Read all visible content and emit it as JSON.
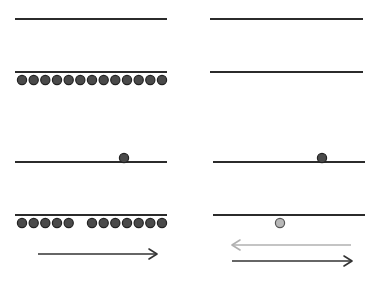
{
  "colors": {
    "line": "#2b2b2b",
    "dot_fill": "#4a4a4a",
    "dot_stroke": "#222222",
    "dot_light_fill": "#b8b8b8",
    "dot_light_stroke": "#555555",
    "arrow_dark": "#333333",
    "arrow_light": "#b0b0b0"
  },
  "panels": [
    {
      "id": "left",
      "lines": [
        {
          "x1": 15,
          "x2": 167,
          "y": 19
        },
        {
          "x1": 15,
          "x2": 167,
          "y": 72
        },
        {
          "x1": 15,
          "x2": 167,
          "y": 162
        },
        {
          "x1": 15,
          "x2": 167,
          "y": 215
        }
      ],
      "dots": [
        {
          "x": 22,
          "y": 80,
          "style": "dark"
        },
        {
          "x": 33.7,
          "y": 80,
          "style": "dark"
        },
        {
          "x": 45.3,
          "y": 80,
          "style": "dark"
        },
        {
          "x": 57,
          "y": 80,
          "style": "dark"
        },
        {
          "x": 68.7,
          "y": 80,
          "style": "dark"
        },
        {
          "x": 80.3,
          "y": 80,
          "style": "dark"
        },
        {
          "x": 92,
          "y": 80,
          "style": "dark"
        },
        {
          "x": 103.7,
          "y": 80,
          "style": "dark"
        },
        {
          "x": 115.3,
          "y": 80,
          "style": "dark"
        },
        {
          "x": 127,
          "y": 80,
          "style": "dark"
        },
        {
          "x": 138.7,
          "y": 80,
          "style": "dark"
        },
        {
          "x": 150.3,
          "y": 80,
          "style": "dark"
        },
        {
          "x": 162,
          "y": 80,
          "style": "dark"
        },
        {
          "x": 124,
          "y": 158,
          "style": "dark"
        },
        {
          "x": 22,
          "y": 223,
          "style": "dark"
        },
        {
          "x": 33.7,
          "y": 223,
          "style": "dark"
        },
        {
          "x": 45.3,
          "y": 223,
          "style": "dark"
        },
        {
          "x": 57,
          "y": 223,
          "style": "dark"
        },
        {
          "x": 68.7,
          "y": 223,
          "style": "dark"
        },
        {
          "x": 92,
          "y": 223,
          "style": "dark"
        },
        {
          "x": 103.7,
          "y": 223,
          "style": "dark"
        },
        {
          "x": 115.3,
          "y": 223,
          "style": "dark"
        },
        {
          "x": 127,
          "y": 223,
          "style": "dark"
        },
        {
          "x": 138.7,
          "y": 223,
          "style": "dark"
        },
        {
          "x": 150.3,
          "y": 223,
          "style": "dark"
        },
        {
          "x": 162,
          "y": 223,
          "style": "dark"
        }
      ],
      "arrows": [
        {
          "x1": 38,
          "x2": 157,
          "y": 254,
          "direction": "right",
          "style": "dark"
        }
      ]
    },
    {
      "id": "right",
      "lines": [
        {
          "x1": 210,
          "x2": 363,
          "y": 19
        },
        {
          "x1": 210,
          "x2": 363,
          "y": 72
        },
        {
          "x1": 213,
          "x2": 365,
          "y": 162
        },
        {
          "x1": 213,
          "x2": 365,
          "y": 215
        }
      ],
      "dots": [
        {
          "x": 322,
          "y": 158,
          "style": "dark"
        },
        {
          "x": 280,
          "y": 223,
          "style": "light"
        }
      ],
      "arrows": [
        {
          "x1": 232,
          "x2": 351,
          "y": 245,
          "direction": "left",
          "style": "light"
        },
        {
          "x1": 232,
          "x2": 352,
          "y": 261,
          "direction": "right",
          "style": "dark"
        }
      ]
    }
  ]
}
